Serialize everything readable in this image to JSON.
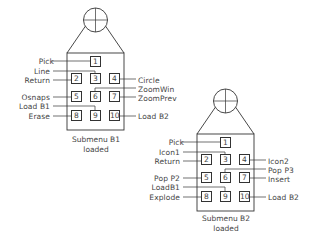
{
  "devices": [
    {
      "id": "b1",
      "origin": [
        67,
        0
      ],
      "caption_line1": "Submenu B1",
      "caption_line2": "loaded",
      "keys": [
        "1",
        "2",
        "3",
        "4",
        "5",
        "6",
        "7",
        "8",
        "9",
        "10"
      ],
      "left_labels": [
        "Pick",
        "Line",
        "Return",
        "Osnaps",
        "Load B1",
        "Erase"
      ],
      "right_labels": [
        "Circle",
        "ZoomWin",
        "ZoomPrev",
        "Load B2"
      ]
    },
    {
      "id": "b2",
      "origin": [
        197,
        81
      ],
      "caption_line1": "Submenu B2",
      "caption_line2": "loaded",
      "keys": [
        "1",
        "2",
        "3",
        "4",
        "5",
        "6",
        "7",
        "8",
        "9",
        "10"
      ],
      "left_labels": [
        "Pick",
        "Icon1",
        "Return",
        "Pop P2",
        "LoadB1",
        "Explode"
      ],
      "right_labels": [
        "Icon2",
        "Pop P3",
        "Insert",
        "Load B2"
      ]
    }
  ],
  "colors": {
    "stroke": "#333333",
    "text": "#444444",
    "background": "#ffffff"
  }
}
